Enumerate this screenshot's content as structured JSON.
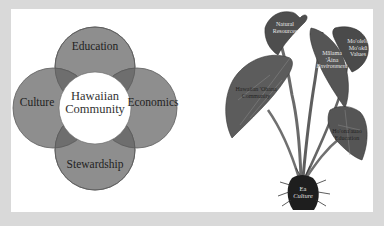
{
  "venn": {
    "center": {
      "line1": "Hawaiian",
      "line2": "Community"
    },
    "petals": {
      "top": "Education",
      "left": "Culture",
      "right": "Economics",
      "bottom": "Stewardship"
    },
    "colors": {
      "petal_fill": "#8e8e8e",
      "overlap_fill": "#6e6e6e",
      "petal_stroke": "#5a5a5a",
      "center_fill": "#ffffff"
    }
  },
  "taro": {
    "labels": {
      "top_leaf": {
        "line1": "Natural",
        "line2": "Resources"
      },
      "upper_right_leaf": {
        "line1": "Mo'olelo",
        "line2": "Mo'okū",
        "line3": "Values"
      },
      "middle_right": {
        "line1": "Mālama",
        "line2": "'Āina",
        "line3": "Environment"
      },
      "left_leaf": {
        "line1": "Hawaiian 'Ohana",
        "line2": "Community"
      },
      "lower_right_leaf": {
        "line1": "Ho'ona'auao",
        "line2": "Education"
      },
      "corm": {
        "line1": "Ea",
        "line2": "Culture"
      }
    },
    "colors": {
      "leaf": "#5c5c5c",
      "leaf_dark": "#3a3a3a",
      "stem": "#6a6a6a",
      "corm": "#1e1e1e"
    }
  },
  "background": "#d9d9d9",
  "panel": "#ffffff"
}
